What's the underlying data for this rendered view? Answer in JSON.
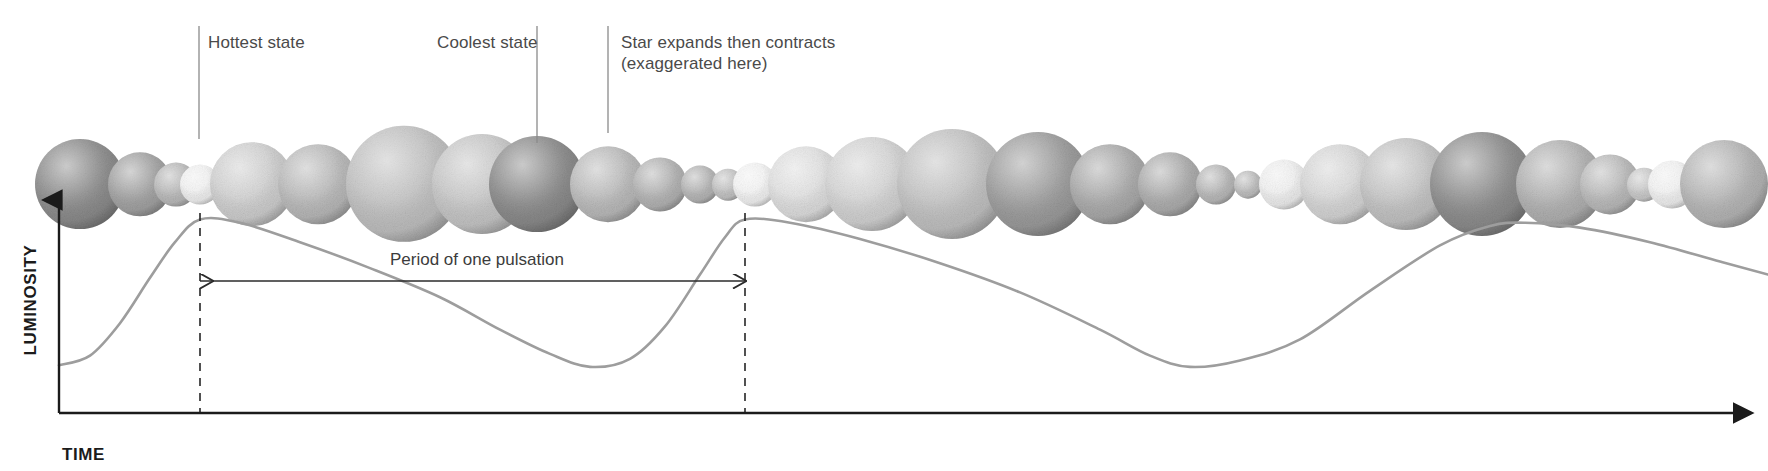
{
  "figure": {
    "background_color": "#ffffff"
  },
  "callouts": [
    {
      "id": "hottest",
      "label": "Hottest state",
      "text_x": 208,
      "text_y": 48,
      "leader_x": 199,
      "leader_y1": 26,
      "leader_y2": 139
    },
    {
      "id": "coolest",
      "label": "Coolest state",
      "text_x": 437,
      "text_y": 48,
      "leader_x": 537,
      "leader_y1": 26,
      "leader_y2": 143
    },
    {
      "id": "expands-contracts",
      "label_line1": "Star expands then contracts",
      "label_line2": "(exaggerated here)",
      "text_x": 621,
      "text_y": 48,
      "text_y2": 69,
      "leader_x": 608,
      "leader_y1": 26,
      "leader_y2": 133
    }
  ],
  "axes": {
    "y_label": "LUMINOSITY",
    "x_label": "TIME",
    "y_label_x": 36,
    "y_label_y": 300,
    "x_label_x": 62,
    "x_label_y": 460,
    "origin_x": 59,
    "origin_y": 413,
    "y_top": 200,
    "x_right": 1751,
    "color": "#1b1b1b"
  },
  "period_annotation": {
    "label": "Period of one pulsation",
    "text_x": 390,
    "text_y": 265,
    "arrow_y": 281,
    "arrow_x1": 200,
    "arrow_x2": 745
  },
  "markers": {
    "dashed_lines": [
      {
        "id": "peak-1-marker",
        "x": 200,
        "y1": 213,
        "y2": 413
      },
      {
        "id": "peak-2-marker",
        "x": 745,
        "y1": 213,
        "y2": 413
      }
    ]
  },
  "chart_data": {
    "type": "line",
    "xlabel": "TIME",
    "ylabel": "LUMINOSITY",
    "series_name": "Luminosity",
    "line_color": "#9d9d9d",
    "grid": false,
    "legend": "none",
    "axis_ticks": "none",
    "xlim": [
      0,
      1768
    ],
    "ylim": [
      0,
      1
    ],
    "period_px": 545,
    "peaks_x": [
      200,
      745,
      1525
    ],
    "troughs_x": [
      590,
      1185
    ],
    "points": [
      {
        "x": 59,
        "y": 0.06
      },
      {
        "x": 90,
        "y": 0.12
      },
      {
        "x": 120,
        "y": 0.32
      },
      {
        "x": 150,
        "y": 0.6
      },
      {
        "x": 175,
        "y": 0.82
      },
      {
        "x": 200,
        "y": 0.96
      },
      {
        "x": 240,
        "y": 0.94
      },
      {
        "x": 300,
        "y": 0.82
      },
      {
        "x": 370,
        "y": 0.66
      },
      {
        "x": 440,
        "y": 0.48
      },
      {
        "x": 500,
        "y": 0.28
      },
      {
        "x": 550,
        "y": 0.13
      },
      {
        "x": 590,
        "y": 0.05
      },
      {
        "x": 630,
        "y": 0.1
      },
      {
        "x": 665,
        "y": 0.3
      },
      {
        "x": 700,
        "y": 0.62
      },
      {
        "x": 725,
        "y": 0.85
      },
      {
        "x": 745,
        "y": 0.96
      },
      {
        "x": 790,
        "y": 0.94
      },
      {
        "x": 860,
        "y": 0.84
      },
      {
        "x": 940,
        "y": 0.69
      },
      {
        "x": 1020,
        "y": 0.51
      },
      {
        "x": 1100,
        "y": 0.28
      },
      {
        "x": 1150,
        "y": 0.12
      },
      {
        "x": 1190,
        "y": 0.05
      },
      {
        "x": 1240,
        "y": 0.09
      },
      {
        "x": 1300,
        "y": 0.22
      },
      {
        "x": 1370,
        "y": 0.52
      },
      {
        "x": 1440,
        "y": 0.8
      },
      {
        "x": 1490,
        "y": 0.92
      },
      {
        "x": 1525,
        "y": 0.94
      },
      {
        "x": 1580,
        "y": 0.91
      },
      {
        "x": 1650,
        "y": 0.82
      },
      {
        "x": 1720,
        "y": 0.7
      },
      {
        "x": 1768,
        "y": 0.62
      }
    ]
  },
  "star_sequence": {
    "description": "Row of spheres showing the star expanding and contracting through its pulsation cycle; bright small spheres are hottest, large dark spheres are coolest.",
    "baseline_y": 185,
    "stars": [
      {
        "cx": 80,
        "r": 45,
        "shade": "#8e8e8e",
        "state": "cool-large"
      },
      {
        "cx": 140,
        "r": 32,
        "shade": "#a5a5a5",
        "state": "contracting"
      },
      {
        "cx": 176,
        "r": 22,
        "shade": "#bdbdbd",
        "state": "contracting"
      },
      {
        "cx": 200,
        "r": 20,
        "shade": "#f4f4f4",
        "state": "hottest"
      },
      {
        "cx": 252,
        "r": 42,
        "shade": "#d2d2d2",
        "state": "expanding"
      },
      {
        "cx": 318,
        "r": 40,
        "shade": "#bcbcbc",
        "state": "expanding"
      },
      {
        "cx": 404,
        "r": 58,
        "shade": "#c3c3c3",
        "state": "expanding"
      },
      {
        "cx": 482,
        "r": 50,
        "shade": "#c9c9c9",
        "state": "expanding"
      },
      {
        "cx": 537,
        "r": 48,
        "shade": "#8d8d8d",
        "state": "coolest"
      },
      {
        "cx": 608,
        "r": 38,
        "shade": "#bdbdbd",
        "state": "contracting"
      },
      {
        "cx": 660,
        "r": 27,
        "shade": "#b6b6b6",
        "state": "contracting"
      },
      {
        "cx": 700,
        "r": 19,
        "shade": "#b9b9b9",
        "state": "contracting"
      },
      {
        "cx": 728,
        "r": 16,
        "shade": "#c6c6c6",
        "state": "contracting"
      },
      {
        "cx": 755,
        "r": 22,
        "shade": "#f6f6f6",
        "state": "hottest"
      },
      {
        "cx": 806,
        "r": 38,
        "shade": "#e2e2e2",
        "state": "expanding"
      },
      {
        "cx": 872,
        "r": 47,
        "shade": "#d6d6d6",
        "state": "expanding"
      },
      {
        "cx": 952,
        "r": 55,
        "shade": "#c4c4c4",
        "state": "expanding"
      },
      {
        "cx": 1038,
        "r": 52,
        "shade": "#9e9e9e",
        "state": "cool-large"
      },
      {
        "cx": 1110,
        "r": 40,
        "shade": "#adadad",
        "state": "contracting"
      },
      {
        "cx": 1170,
        "r": 32,
        "shade": "#b0b0b0",
        "state": "contracting"
      },
      {
        "cx": 1216,
        "r": 20,
        "shade": "#bcbcbc",
        "state": "contracting"
      },
      {
        "cx": 1248,
        "r": 14,
        "shade": "#c2c2c2",
        "state": "contracting"
      },
      {
        "cx": 1284,
        "r": 25,
        "shade": "#f2f2f2",
        "state": "hottest"
      },
      {
        "cx": 1340,
        "r": 40,
        "shade": "#d9d9d9",
        "state": "expanding"
      },
      {
        "cx": 1406,
        "r": 46,
        "shade": "#c6c6c6",
        "state": "expanding"
      },
      {
        "cx": 1482,
        "r": 52,
        "shade": "#8f8f8f",
        "state": "coolest"
      },
      {
        "cx": 1560,
        "r": 44,
        "shade": "#b4b4b4",
        "state": "contracting"
      },
      {
        "cx": 1610,
        "r": 30,
        "shade": "#bdbdbd",
        "state": "contracting"
      },
      {
        "cx": 1644,
        "r": 17,
        "shade": "#cdcdcd",
        "state": "contracting"
      },
      {
        "cx": 1672,
        "r": 24,
        "shade": "#f4f4f4",
        "state": "hottest"
      },
      {
        "cx": 1724,
        "r": 44,
        "shade": "#b8b8b8",
        "state": "expanding"
      }
    ]
  }
}
